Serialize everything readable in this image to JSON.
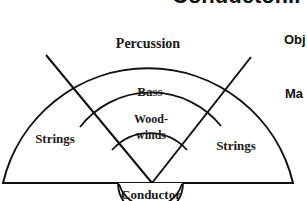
{
  "diagram": {
    "title_partial": "Conductor...",
    "sections": {
      "percussion": "Percussion",
      "bass": "Bass",
      "woodwinds_line1": "Wood-",
      "woodwinds_line2": "winds",
      "strings_left": "Strings",
      "strings_right": "Strings",
      "conductor": "Conductor"
    },
    "side_text": {
      "obj": "Obj",
      "ma": "Ma"
    },
    "colors": {
      "stroke": "#111111",
      "background": "#ffffff"
    }
  }
}
